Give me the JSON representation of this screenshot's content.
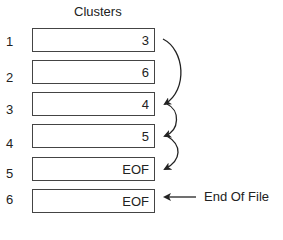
{
  "title": "Clusters",
  "clusters": [
    {
      "index": "1",
      "value": "3"
    },
    {
      "index": "2",
      "value": "6"
    },
    {
      "index": "3",
      "value": "4"
    },
    {
      "index": "4",
      "value": "5"
    },
    {
      "index": "5",
      "value": "EOF"
    },
    {
      "index": "6",
      "value": "EOF"
    }
  ],
  "chain": [
    [
      1,
      3
    ],
    [
      3,
      4
    ],
    [
      4,
      5
    ]
  ],
  "annotation": {
    "label": "End Of File",
    "points_to_cluster": 6
  }
}
